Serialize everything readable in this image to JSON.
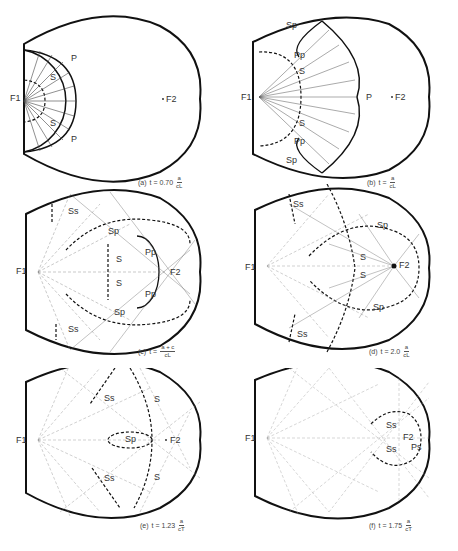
{
  "figure": {
    "panels": [
      {
        "id": "a",
        "tag": "(a)",
        "t_prefix": "t = 0.70",
        "num": "a",
        "den": "cL",
        "labels": {
          "f1": "F1",
          "f2": "F2",
          "p": "P",
          "s": "S"
        }
      },
      {
        "id": "b",
        "tag": "(b)",
        "t_prefix": "t =",
        "num": "a",
        "den": "cL",
        "labels": {
          "f1": "F1",
          "f2": "F2",
          "p": "P",
          "s": "S",
          "sp": "Sp",
          "pp": "Pp"
        }
      },
      {
        "id": "c",
        "tag": "(c)",
        "t_prefix": "t =",
        "num": "a + c",
        "den": "cL",
        "labels": {
          "f1": "F1",
          "f2": "F2",
          "s": "S",
          "sp": "Sp",
          "pp": "Pp",
          "ss": "Ss"
        }
      },
      {
        "id": "d",
        "tag": "(d)",
        "t_prefix": "t = 2.0",
        "num": "a",
        "den": "cL",
        "labels": {
          "f1": "F1",
          "f2": "F2",
          "s": "S",
          "sp": "Sp",
          "ss": "Ss"
        }
      },
      {
        "id": "e",
        "tag": "(e)",
        "t_prefix": "t = 1.23",
        "num": "a",
        "den": "cT",
        "labels": {
          "f1": "F1",
          "f2": "F2",
          "s": "S",
          "sp": "Sp",
          "ss": "Ss"
        }
      },
      {
        "id": "f",
        "tag": "(f)",
        "t_prefix": "t = 1.75",
        "num": "a",
        "den": "cT",
        "labels": {
          "f1": "F1",
          "f2": "F2",
          "ss": "Ss",
          "ps": "Ps"
        }
      }
    ]
  }
}
